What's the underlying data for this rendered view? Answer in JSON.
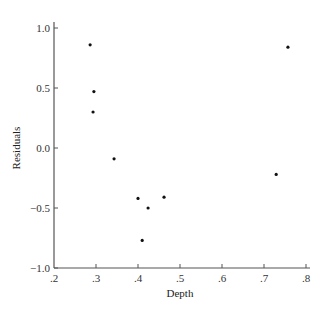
{
  "chart_data": {
    "type": "scatter",
    "title": "",
    "xlabel": "Depth",
    "ylabel": "Residuals",
    "xlim": [
      0.2,
      0.8
    ],
    "ylim": [
      -1.0,
      1.0
    ],
    "x_ticks": [
      0.2,
      0.3,
      0.4,
      0.5,
      0.6,
      0.7,
      0.8
    ],
    "x_tick_labels": [
      ".2",
      ".3",
      ".4",
      ".5",
      ".6",
      ".7",
      ".8"
    ],
    "y_ticks": [
      1.0,
      0.5,
      0.0,
      -0.5,
      -1.0
    ],
    "y_tick_labels": [
      "1.0",
      "0.5",
      "0.0",
      "−0.5",
      "−1.0"
    ],
    "grid": false,
    "legend": null,
    "points": [
      {
        "x": 0.286,
        "y": 0.86
      },
      {
        "x": 0.295,
        "y": 0.47
      },
      {
        "x": 0.293,
        "y": 0.3
      },
      {
        "x": 0.343,
        "y": -0.09
      },
      {
        "x": 0.4,
        "y": -0.42
      },
      {
        "x": 0.41,
        "y": -0.77
      },
      {
        "x": 0.424,
        "y": -0.5
      },
      {
        "x": 0.462,
        "y": -0.41
      },
      {
        "x": 0.729,
        "y": -0.22
      },
      {
        "x": 0.757,
        "y": 0.84
      }
    ]
  },
  "colors": {
    "point": "#111111",
    "axis": "#555555",
    "background": "#ffffff"
  }
}
